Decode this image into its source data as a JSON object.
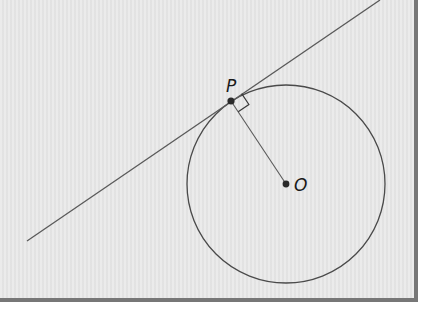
{
  "diagram": {
    "type": "geometry-tangent",
    "labels": {
      "point_p": "P",
      "point_o": "O"
    },
    "colors": {
      "background": "#e7e7e7",
      "border": "#777777",
      "stroke": "#555555",
      "point": "#2a2a2a"
    },
    "circle": {
      "cx": 286,
      "cy": 184,
      "r": 99
    },
    "tangent_line": {
      "x1": 380,
      "y1": 0,
      "x2": 27,
      "y2": 241
    },
    "point_p": {
      "x": 231,
      "y": 101
    },
    "point_o": {
      "x": 286,
      "y": 184
    },
    "right_angle_marker": true
  }
}
